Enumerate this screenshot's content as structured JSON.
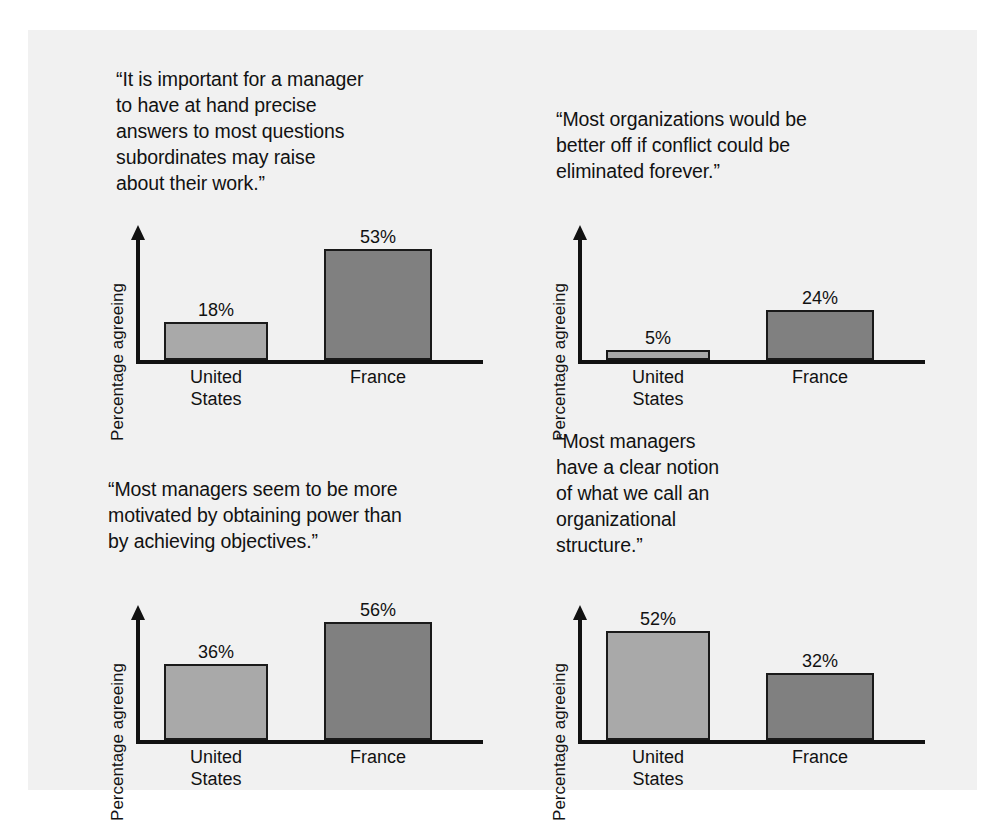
{
  "figure": {
    "ylabel": "Percentage agreeing",
    "categories": [
      "United\nStates",
      "France"
    ],
    "colors": {
      "united_states_bar": "#a9a9a9",
      "france_bar": "#808080",
      "bar_outline": "#1a1a1a",
      "page_background": "#f1f1f1",
      "text": "#121212"
    }
  },
  "panels": [
    {
      "quote": "“It is important for a manager\nto have at hand precise\nanswers to most questions\nsubordinates may raise\nabout their work.”",
      "ylabel": "Percentage agreeing",
      "bars": [
        {
          "category": "United\nStates",
          "value": 18,
          "value_label": "18%"
        },
        {
          "category": "France",
          "value": 53,
          "value_label": "53%"
        }
      ]
    },
    {
      "quote": "“Most organizations would be\nbetter off if conflict could be\neliminated forever.”",
      "ylabel": "Percentage agreeing",
      "bars": [
        {
          "category": "United\nStates",
          "value": 5,
          "value_label": "5%"
        },
        {
          "category": "France",
          "value": 24,
          "value_label": "24%"
        }
      ]
    },
    {
      "quote": "“Most managers seem to be more\nmotivated by obtaining power than\nby achieving objectives.”",
      "ylabel": "Percentage agreeing",
      "bars": [
        {
          "category": "United\nStates",
          "value": 36,
          "value_label": "36%"
        },
        {
          "category": "France",
          "value": 56,
          "value_label": "56%"
        }
      ]
    },
    {
      "quote": "“Most managers\nhave a clear notion\nof what we call an\norganizational\nstructure.”",
      "ylabel": "Percentage agreeing",
      "bars": [
        {
          "category": "United\nStates",
          "value": 52,
          "value_label": "52%"
        },
        {
          "category": "France",
          "value": 32,
          "value_label": "32%"
        }
      ]
    }
  ],
  "chart_data": [
    {
      "type": "bar",
      "title": "“It is important for a manager to have at hand precise answers to most questions subordinates may raise about their work.”",
      "categories": [
        "United States",
        "France"
      ],
      "values": [
        18,
        53
      ],
      "xlabel": "",
      "ylabel": "Percentage agreeing",
      "ylim": [
        0,
        60
      ],
      "grid": false,
      "legend": "none"
    },
    {
      "type": "bar",
      "title": "“Most organizations would be better off if conflict could be eliminated forever.”",
      "categories": [
        "United States",
        "France"
      ],
      "values": [
        5,
        24
      ],
      "xlabel": "",
      "ylabel": "Percentage agreeing",
      "ylim": [
        0,
        60
      ],
      "grid": false,
      "legend": "none"
    },
    {
      "type": "bar",
      "title": "“Most managers seem to be more motivated by obtaining power than by achieving objectives.”",
      "categories": [
        "United States",
        "France"
      ],
      "values": [
        36,
        56
      ],
      "xlabel": "",
      "ylabel": "Percentage agreeing",
      "ylim": [
        0,
        60
      ],
      "grid": false,
      "legend": "none"
    },
    {
      "type": "bar",
      "title": "“Most managers have a clear notion of what we call an organizational structure.”",
      "categories": [
        "United States",
        "France"
      ],
      "values": [
        52,
        32
      ],
      "xlabel": "",
      "ylabel": "Percentage agreeing",
      "ylim": [
        0,
        60
      ],
      "grid": false,
      "legend": "none"
    }
  ]
}
